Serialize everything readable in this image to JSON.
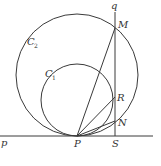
{
  "diagram": {
    "type": "geometry",
    "lines": [
      {
        "name": "p",
        "label": "p",
        "kind": "tangent-line"
      },
      {
        "name": "q",
        "label": "q",
        "kind": "vertical-line"
      }
    ],
    "circles": [
      {
        "name": "C1",
        "label": "C",
        "subscript": "1"
      },
      {
        "name": "C2",
        "label": "C",
        "subscript": "2"
      }
    ],
    "points": [
      {
        "name": "P",
        "label": "P"
      },
      {
        "name": "S",
        "label": "S"
      },
      {
        "name": "M",
        "label": "M"
      },
      {
        "name": "R",
        "label": "R"
      },
      {
        "name": "N",
        "label": "N"
      }
    ],
    "segments": [
      "PM",
      "PR",
      "PN"
    ],
    "stroke_color": "#3a3a3a",
    "background": "#ffffff"
  }
}
